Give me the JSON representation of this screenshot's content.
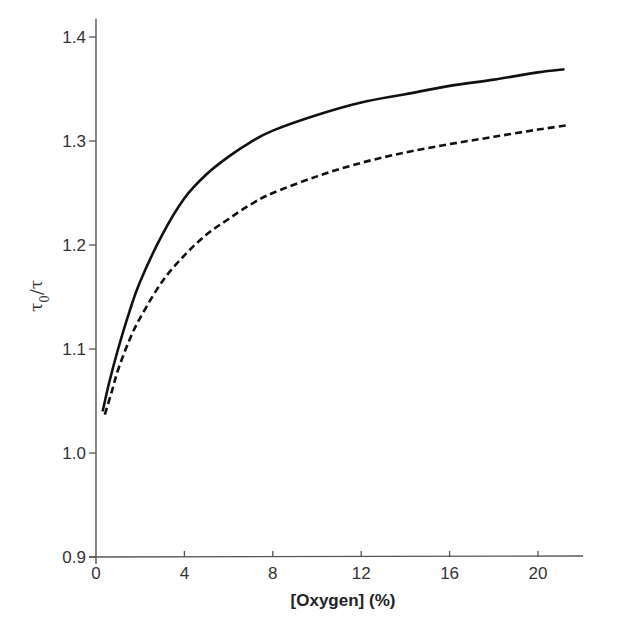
{
  "chart_data": {
    "type": "line",
    "title": "",
    "xlabel": "[Oxygen]  (%)",
    "ylabel": "τ0/τ",
    "ylabel_main": "τ",
    "ylabel_sub": "0",
    "ylabel_rest": "/τ",
    "xlim": [
      0,
      22
    ],
    "ylim": [
      0.9,
      1.4
    ],
    "xticks": [
      0,
      4,
      8,
      12,
      16,
      20
    ],
    "xtick_labels": [
      "0",
      "4",
      "8",
      "12",
      "16",
      "20"
    ],
    "yticks": [
      0.9,
      1.0,
      1.1,
      1.2,
      1.3,
      1.4
    ],
    "ytick_labels": [
      "0.9",
      "1.0",
      "1.1",
      "1.2",
      "1.3",
      "1.4"
    ],
    "grid": false,
    "legend": null,
    "series": [
      {
        "name": "solid",
        "style": "solid",
        "color": "#111111",
        "x": [
          0.3,
          0.6,
          1.0,
          1.5,
          2.0,
          3.0,
          4.0,
          5.0,
          6.0,
          7.0,
          8.0,
          10.0,
          12.0,
          14.0,
          16.0,
          18.0,
          20.0,
          21.2
        ],
        "y": [
          1.04,
          1.068,
          1.1,
          1.135,
          1.165,
          1.21,
          1.245,
          1.268,
          1.285,
          1.299,
          1.31,
          1.325,
          1.337,
          1.345,
          1.353,
          1.359,
          1.366,
          1.369
        ]
      },
      {
        "name": "dashed",
        "style": "dashed",
        "color": "#111111",
        "x": [
          0.4,
          0.7,
          1.0,
          1.5,
          2.0,
          3.0,
          4.0,
          5.0,
          6.0,
          7.0,
          8.0,
          10.0,
          12.0,
          14.0,
          16.0,
          18.0,
          20.0,
          21.3
        ],
        "y": [
          1.037,
          1.058,
          1.08,
          1.108,
          1.13,
          1.165,
          1.19,
          1.21,
          1.225,
          1.239,
          1.25,
          1.266,
          1.279,
          1.289,
          1.297,
          1.304,
          1.311,
          1.315
        ]
      }
    ]
  }
}
